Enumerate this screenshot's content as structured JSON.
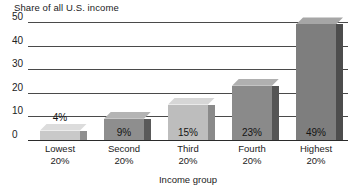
{
  "chart_data": {
    "type": "bar",
    "title": "",
    "ylabel": "Share of all U.S. income",
    "xlabel": "Income group",
    "categories": [
      "Lowest 20%",
      "Second 20%",
      "Third 20%",
      "Fourth 20%",
      "Highest 20%"
    ],
    "category_lines": [
      {
        "line1": "Lowest",
        "line2": "20%"
      },
      {
        "line1": "Second",
        "line2": "20%"
      },
      {
        "line1": "Third",
        "line2": "20%"
      },
      {
        "line1": "Fourth",
        "line2": "20%"
      },
      {
        "line1": "Highest",
        "line2": "20%"
      }
    ],
    "values": [
      4,
      9,
      15,
      23,
      49
    ],
    "data_labels": [
      "4%",
      "9%",
      "15%",
      "23%",
      "49%"
    ],
    "ylim": [
      0,
      50
    ],
    "yticks": [
      50,
      40,
      30,
      20,
      10,
      0
    ],
    "ytick_labels": [
      "50",
      "40",
      "30",
      "20",
      "10",
      "0"
    ],
    "grid": true,
    "legend": false,
    "bar_colors": [
      "#c9c9c9",
      "#8e8e8e",
      "#bdbdbd",
      "#8a8a8a",
      "#7e7e7e"
    ]
  },
  "style": {
    "background": "#ffffff",
    "gridline_color": "#4a4a4a",
    "axis_color": "#2b2b2b",
    "text_color": "#222222"
  }
}
